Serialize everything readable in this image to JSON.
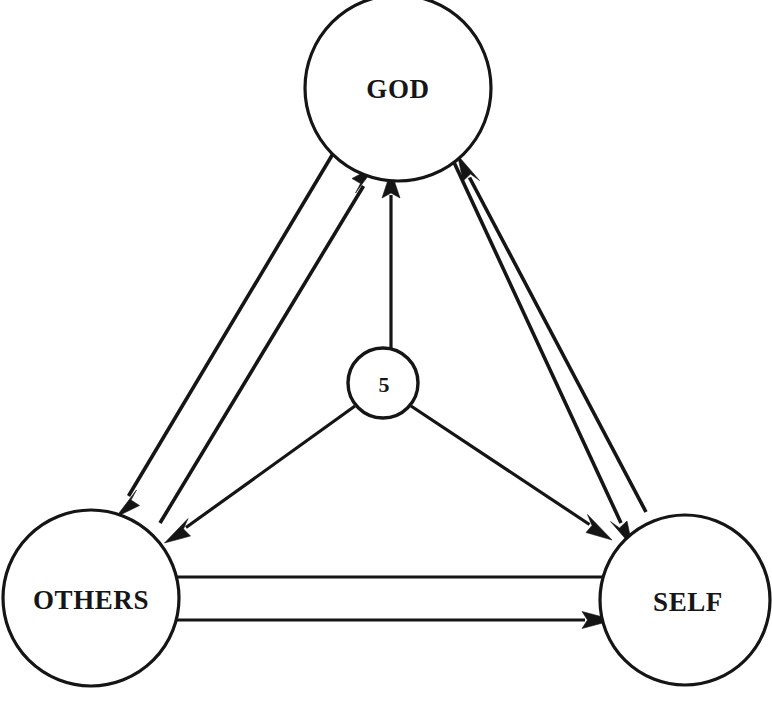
{
  "diagram": {
    "type": "relationship-triangle",
    "background_color": "#ffffff",
    "stroke_color": "#151515",
    "nodes": [
      {
        "id": "god",
        "label": "GOD",
        "cx": 398,
        "cy": 88,
        "r": 93,
        "size": "major"
      },
      {
        "id": "others",
        "label": "OTHERS",
        "cx": 91,
        "cy": 598,
        "r": 88,
        "size": "major"
      },
      {
        "id": "self",
        "label": "SELF",
        "cx": 685,
        "cy": 600,
        "r": 85,
        "size": "major"
      },
      {
        "id": "center",
        "label": "5",
        "cx": 383,
        "cy": 383,
        "r": 35,
        "size": "minor"
      }
    ],
    "edges": [
      {
        "id": "god-to-others",
        "from": "god",
        "to": "others",
        "arrow": "to"
      },
      {
        "id": "others-to-god",
        "from": "others",
        "to": "god",
        "arrow": "to"
      },
      {
        "id": "god-to-self",
        "from": "god",
        "to": "self",
        "arrow": "to"
      },
      {
        "id": "self-to-god",
        "from": "self",
        "to": "god",
        "arrow": "to"
      },
      {
        "id": "center-to-god",
        "from": "center",
        "to": "god",
        "arrow": "to"
      },
      {
        "id": "center-to-others",
        "from": "center",
        "to": "others",
        "arrow": "to"
      },
      {
        "id": "center-to-self",
        "from": "center",
        "to": "self",
        "arrow": "to"
      },
      {
        "id": "self-to-others",
        "from": "self",
        "to": "others",
        "arrow": "to"
      },
      {
        "id": "others-to-self",
        "from": "others",
        "to": "self",
        "arrow": "to"
      }
    ]
  },
  "labels": {
    "god": "GOD",
    "others": "OTHERS",
    "self": "SELF",
    "center": "5"
  }
}
